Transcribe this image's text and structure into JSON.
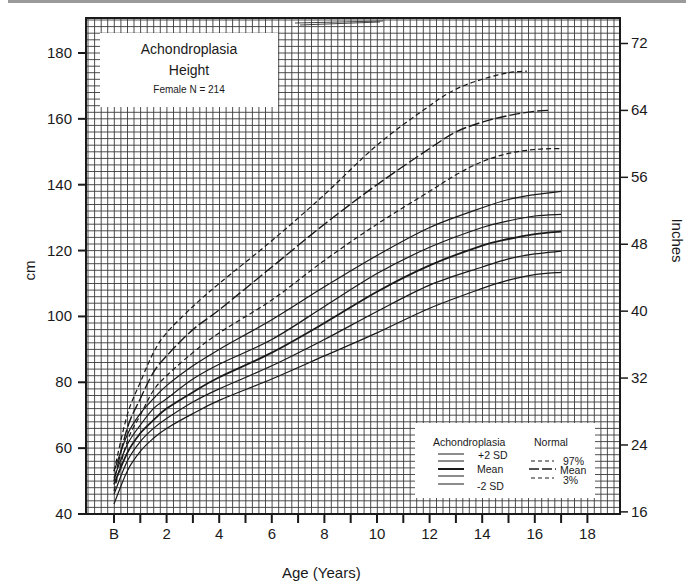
{
  "chart_data": {
    "type": "line",
    "title": "Achondroplasia",
    "subtitle": "Height",
    "note": "Female N = 214",
    "xlabel": "Age (Years)",
    "ylabel": "cm",
    "ylabel_right": "Inches",
    "xlim": [
      -1,
      19
    ],
    "ylim": [
      40,
      190
    ],
    "x_ticks": [
      {
        "value": 0,
        "label": "B"
      },
      {
        "value": 2,
        "label": "2"
      },
      {
        "value": 4,
        "label": "4"
      },
      {
        "value": 6,
        "label": "6"
      },
      {
        "value": 8,
        "label": "8"
      },
      {
        "value": 10,
        "label": "10"
      },
      {
        "value": 12,
        "label": "12"
      },
      {
        "value": 14,
        "label": "14"
      },
      {
        "value": 16,
        "label": "16"
      },
      {
        "value": 18,
        "label": "18"
      }
    ],
    "y_ticks_left": [
      40,
      60,
      80,
      100,
      120,
      140,
      160,
      180
    ],
    "y_ticks_right_inches": [
      16,
      24,
      32,
      40,
      48,
      56,
      64,
      72
    ],
    "grid": true,
    "legend_position": "lower right",
    "series": [
      {
        "name": "Normal 97%",
        "group": "Normal",
        "style": "dashed-short",
        "x": [
          0,
          0.5,
          1,
          1.5,
          2,
          3,
          4,
          6,
          8,
          10,
          12,
          13,
          14,
          15,
          15.7
        ],
        "y": [
          53,
          70,
          80,
          89,
          95,
          103,
          110,
          123,
          137,
          152,
          164,
          169,
          172,
          174,
          174.5
        ]
      },
      {
        "name": "Normal Mean",
        "group": "Normal",
        "style": "dashed-long",
        "x": [
          0,
          0.5,
          1,
          1.5,
          2,
          3,
          4,
          6,
          8,
          10,
          12,
          13,
          14,
          15,
          16,
          16.6
        ],
        "y": [
          50,
          66,
          75,
          83,
          88,
          96,
          102,
          115,
          128,
          140,
          151,
          156,
          159,
          161,
          162.3,
          162.6
        ]
      },
      {
        "name": "Normal 3%",
        "group": "Normal",
        "style": "dashed-short",
        "x": [
          0,
          0.5,
          1,
          1.5,
          2,
          3,
          4,
          6,
          8,
          10,
          12,
          13,
          14,
          15,
          16,
          17
        ],
        "y": [
          47,
          62,
          70,
          77.5,
          82,
          89,
          95,
          105,
          117,
          128,
          138,
          143,
          147,
          149.5,
          150.7,
          151
        ]
      },
      {
        "name": "Achondroplasia +2 SD",
        "group": "Achondroplasia",
        "style": "solid",
        "x": [
          0,
          0.5,
          1,
          1.5,
          2,
          3,
          4,
          6,
          8,
          10,
          12,
          14,
          15,
          16,
          17
        ],
        "y": [
          53,
          64,
          70.5,
          75,
          79,
          85,
          90,
          99,
          109,
          118.5,
          127,
          133,
          135.5,
          137,
          138
        ]
      },
      {
        "name": "Achondroplasia +1 SD",
        "group": "Achondroplasia",
        "style": "solid",
        "x": [
          0,
          0.5,
          1,
          1.5,
          2,
          3,
          4,
          6,
          8,
          10,
          12,
          14,
          15,
          16,
          17
        ],
        "y": [
          51,
          61,
          67,
          72,
          75,
          81,
          85.5,
          93,
          103,
          113,
          121,
          127,
          129,
          130.5,
          131
        ]
      },
      {
        "name": "Achondroplasia Mean",
        "group": "Achondroplasia",
        "style": "solid-bold",
        "x": [
          0,
          0.5,
          1,
          1.5,
          2,
          3,
          4,
          6,
          8,
          10,
          12,
          14,
          15,
          16,
          17
        ],
        "y": [
          49,
          58.5,
          64.5,
          68.5,
          72,
          77,
          81.5,
          89,
          98,
          107.5,
          115.5,
          121.5,
          123.5,
          125,
          125.8
        ]
      },
      {
        "name": "Achondroplasia -1 SD",
        "group": "Achondroplasia",
        "style": "solid",
        "x": [
          0,
          0.5,
          1,
          1.5,
          2,
          3,
          4,
          6,
          8,
          10,
          12,
          14,
          15,
          16,
          17
        ],
        "y": [
          46,
          56,
          62,
          66,
          69,
          74,
          78,
          85,
          93,
          101.5,
          109.5,
          115,
          117.5,
          119,
          119.8
        ]
      },
      {
        "name": "Achondroplasia -2 SD",
        "group": "Achondroplasia",
        "style": "solid",
        "x": [
          0,
          0.5,
          1,
          1.5,
          2,
          3,
          4,
          6,
          8,
          10,
          12,
          14,
          15,
          16,
          17
        ],
        "y": [
          43,
          53,
          59,
          63,
          66,
          70.5,
          74.5,
          81,
          88,
          95,
          102.5,
          108.5,
          111,
          112.7,
          113.4
        ]
      }
    ]
  },
  "title_box": {
    "line1": "Achondroplasia",
    "line2": "Height",
    "line3": "Female N = 214"
  },
  "legend": {
    "left_heading": "Achondroplasia",
    "left_labels": [
      "+2 SD",
      "Mean",
      "-2 SD"
    ],
    "right_heading": "Normal",
    "right_labels": [
      "97%",
      "Mean",
      "3%"
    ]
  },
  "axes": {
    "left_title": "cm",
    "right_title": "Inches",
    "bottom_title": "Age (Years)"
  },
  "colors": {
    "ink": "#1a1a1a",
    "grid": "#3a3a3a",
    "paper": "#ffffff",
    "topbar": "#9a9a9a"
  }
}
